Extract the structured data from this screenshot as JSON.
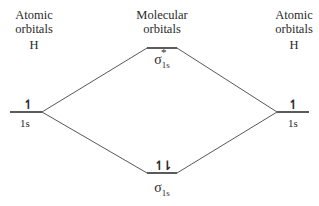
{
  "left_column": {
    "line1": "Atomic",
    "line2": "orbitals",
    "line3": "H"
  },
  "center_column": {
    "line1": "Molecular",
    "line2": "orbitals"
  },
  "right_column": {
    "line1": "Atomic",
    "line2": "orbitals",
    "line3": "H"
  },
  "left_ao": {
    "label": "1s",
    "electrons": "↿"
  },
  "right_ao": {
    "label": "1s",
    "electrons": "↿"
  },
  "antibonding_mo": {
    "symbol": "σ",
    "superscript": "*",
    "subscript": "1s",
    "electrons": ""
  },
  "bonding_mo": {
    "symbol": "σ",
    "subscript": "1s",
    "electrons": "↿⇂"
  },
  "colors": {
    "line": "#333333",
    "text": "#2a2a2a"
  }
}
